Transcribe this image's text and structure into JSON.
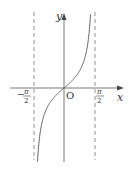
{
  "chart_data": {
    "type": "line",
    "title": "",
    "function": "y = tan x",
    "xlabel": "x",
    "ylabel": "y",
    "origin_label": "O",
    "x_ticks": [
      {
        "value": -1.5708,
        "label_num": "π",
        "label_den": "2",
        "sign": "−"
      },
      {
        "value": 1.5708,
        "label_num": "π",
        "label_den": "2",
        "sign": ""
      }
    ],
    "asymptotes": [
      -1.5708,
      1.5708
    ],
    "series": [
      {
        "name": "tan x",
        "x": [
          -1.35,
          -1.2,
          -1.0,
          -0.8,
          -0.5,
          -0.25,
          0,
          0.25,
          0.5,
          0.8,
          1.0,
          1.2,
          1.35
        ],
        "values": [
          -4.46,
          -2.57,
          -1.56,
          -1.03,
          -0.55,
          -0.26,
          0,
          0.26,
          0.55,
          1.03,
          1.56,
          2.57,
          4.46
        ]
      }
    ],
    "grid": false,
    "legend": "none"
  },
  "colors": {
    "axis": "#555555",
    "curve": "#555555",
    "asymptote": "#777777"
  }
}
